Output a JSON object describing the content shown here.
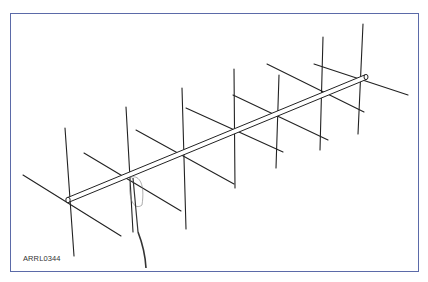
{
  "figure": {
    "label": "ARRL0344",
    "frame_color": "#5b6aa8",
    "line_color": "#222222"
  },
  "antenna": {
    "boom": {
      "x1": 68,
      "y1": 200,
      "x2": 366,
      "y2": 77
    },
    "elements": [
      {
        "v": [
          65,
          128,
          74,
          256
        ],
        "h": [
          23,
          175,
          121,
          236
        ]
      },
      {
        "v": [
          126,
          107,
          133,
          232
        ],
        "h": [
          84,
          153,
          181,
          211
        ]
      },
      {
        "v": [
          182,
          88,
          186,
          229
        ],
        "h": [
          136,
          130,
          234,
          184
        ]
      },
      {
        "v": [
          234,
          69,
          235,
          188
        ],
        "h": [
          186,
          108,
          283,
          152
        ]
      },
      {
        "v": [
          279,
          75,
          276,
          168
        ],
        "h": [
          233,
          95,
          328,
          140
        ]
      },
      {
        "v": [
          323,
          37,
          320,
          150
        ],
        "h": [
          267,
          64,
          364,
          112
        ]
      },
      {
        "v": [
          363,
          24,
          358,
          134
        ],
        "h": [
          314,
          64,
          408,
          95
        ]
      }
    ],
    "feed": {
      "cable": [
        [
          138,
          232
        ],
        [
          145,
          250
        ],
        [
          146,
          268
        ]
      ],
      "loop": [
        [
          131,
          177
        ],
        [
          127,
          195
        ],
        [
          133,
          212
        ],
        [
          142,
          205
        ],
        [
          145,
          185
        ],
        [
          140,
          175
        ]
      ]
    }
  }
}
